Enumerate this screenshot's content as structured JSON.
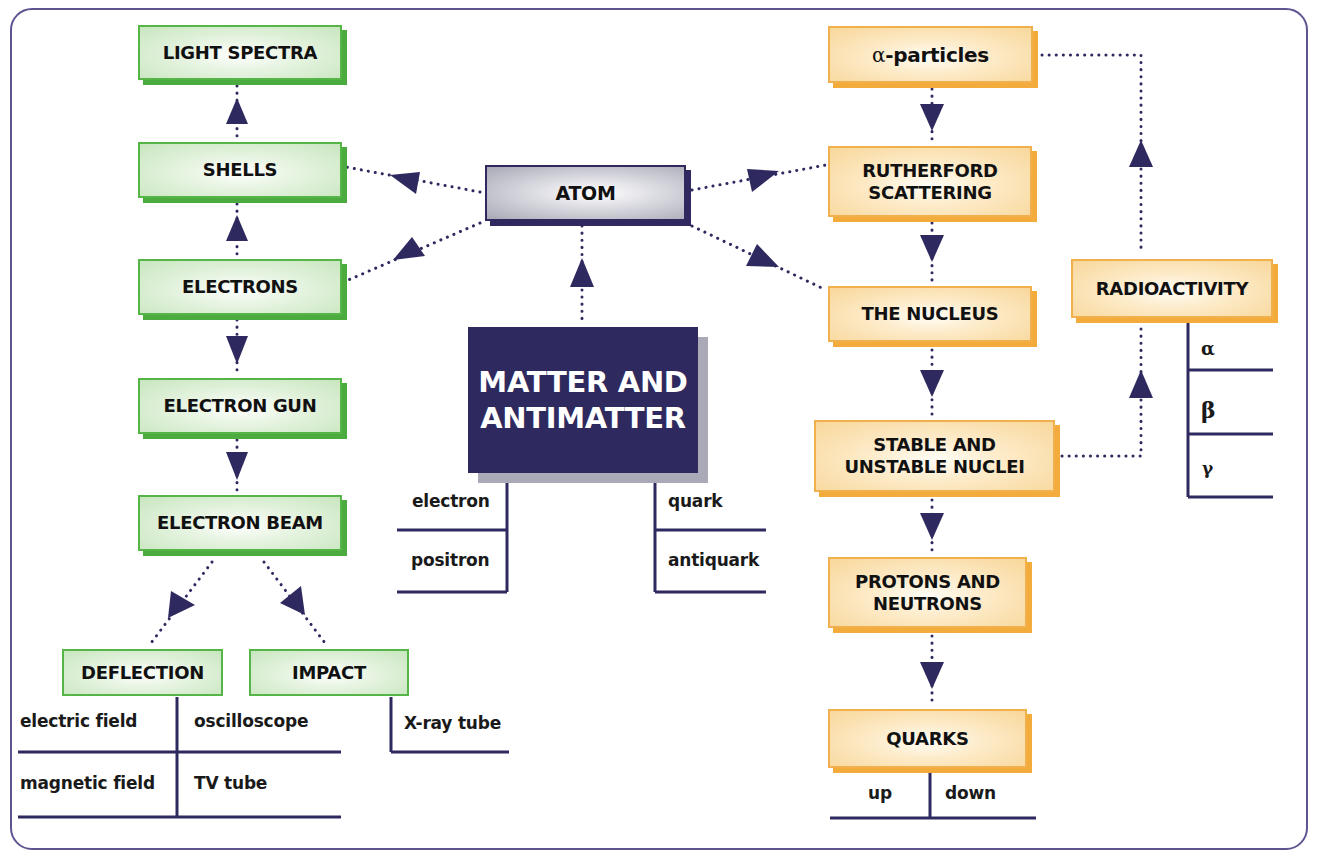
{
  "colors": {
    "frame": "#5d5592",
    "arrow": "#2e295e",
    "green_border": "#55b547",
    "orange_border": "#f2b04d",
    "central_fill": "#2e295e"
  },
  "central": {
    "line1": "MATTER AND",
    "line2": "ANTIMATTER",
    "left_list": [
      "electron",
      "positron"
    ],
    "right_list": [
      "quark",
      "antiquark"
    ]
  },
  "atom": {
    "label": "ATOM"
  },
  "left_branch": {
    "light_spectra": "LIGHT SPECTRA",
    "shells": "SHELLS",
    "electrons": "ELECTRONS",
    "electron_gun": "ELECTRON GUN",
    "electron_beam": "ELECTRON BEAM",
    "deflection": {
      "label": "DEFLECTION",
      "causes": [
        "electric field",
        "magnetic field"
      ],
      "applications": [
        "oscilloscope",
        "TV tube"
      ]
    },
    "impact": {
      "label": "IMPACT",
      "applications": [
        "X-ray tube"
      ]
    }
  },
  "right_branch": {
    "alpha_particles": {
      "symbol": "α",
      "text": "-particles"
    },
    "rutherford": {
      "line1": "RUTHERFORD",
      "line2": "SCATTERING"
    },
    "nucleus": "THE NUCLEUS",
    "stable": {
      "line1": "STABLE AND",
      "line2": "UNSTABLE NUCLEI"
    },
    "protons": {
      "line1": "PROTONS AND",
      "line2": "NEUTRONS"
    },
    "quarks": {
      "label": "QUARKS",
      "types": [
        "up",
        "down"
      ]
    },
    "radioactivity": {
      "label": "RADIOACTIVITY",
      "types": [
        "α",
        "β",
        "γ"
      ]
    }
  }
}
